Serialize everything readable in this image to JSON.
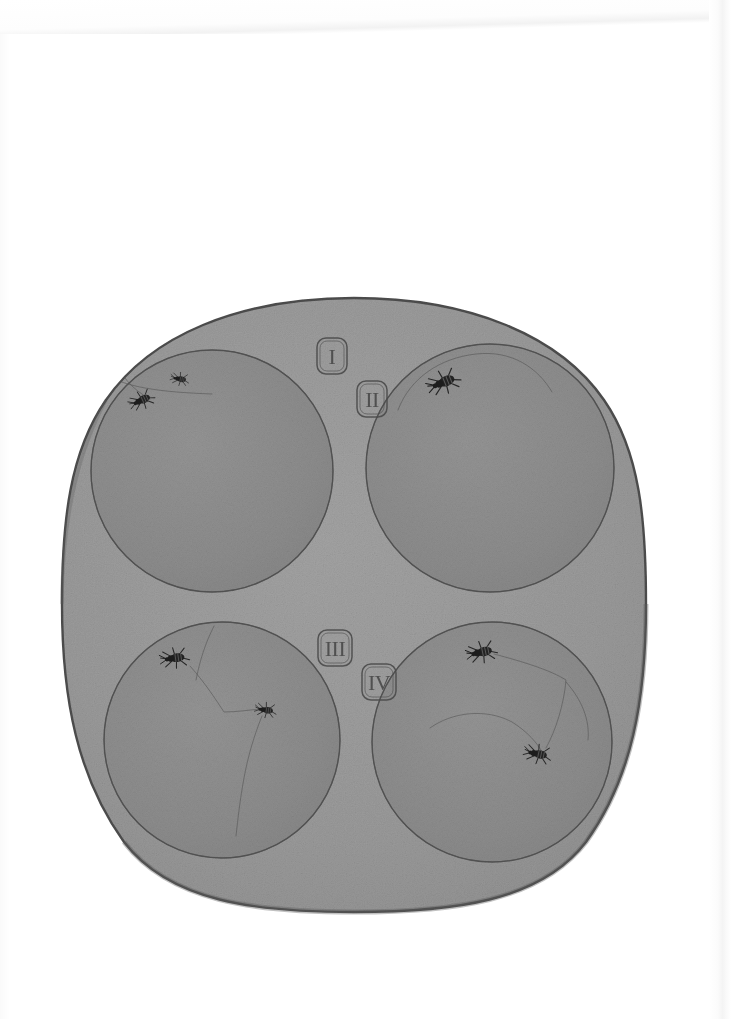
{
  "plate": {
    "medium": "pencil-and-wash drawing on paper",
    "sheet": {
      "width": 731,
      "height": 1019,
      "paper_color": "#ffffff"
    },
    "field": {
      "name": "rounded-square observation field",
      "shape": "squircle",
      "fill_color": "#9b9b9b",
      "outline_color": "#4e4e4e",
      "bounds": {
        "x": 62,
        "y": 298,
        "width": 584,
        "height": 614
      }
    },
    "arena_fill_color": "#8e8e8e",
    "arena_outline_color": "#5a5a5a",
    "insect_color": "#1d1d1d",
    "trail_color": "#555555",
    "label_frame_color": "#4a4a4a"
  },
  "labels": [
    {
      "id": "label-I",
      "text": "I",
      "x": 317,
      "y": 338,
      "w": 30,
      "h": 36
    },
    {
      "id": "label-II",
      "text": "II",
      "x": 357,
      "y": 381,
      "w": 30,
      "h": 36
    },
    {
      "id": "label-III",
      "text": "III",
      "x": 318,
      "y": 630,
      "w": 34,
      "h": 36
    },
    {
      "id": "label-IV",
      "text": "IV",
      "x": 362,
      "y": 664,
      "w": 34,
      "h": 36
    }
  ],
  "arenas": [
    {
      "id": "arena-1",
      "label": "I",
      "cx": 212,
      "cy": 471,
      "r": 121,
      "insect_count": 2,
      "insects": [
        {
          "id": "insect-1-1",
          "x": 142,
          "y": 400,
          "rot": -25,
          "size": 17
        },
        {
          "id": "insect-1-2",
          "x": 180,
          "y": 379,
          "rot": 10,
          "size": 12
        }
      ],
      "trails": [
        "M 100 372 C 126 388 160 392 212 394",
        "M 112 356 C 122 376 130 388 150 399"
      ]
    },
    {
      "id": "arena-2",
      "label": "II",
      "cx": 490,
      "cy": 468,
      "r": 124,
      "insect_count": 1,
      "insects": [
        {
          "id": "insect-2-1",
          "x": 444,
          "y": 382,
          "rot": -22,
          "size": 22
        }
      ],
      "trails": [
        "M 398 410 C 410 378 440 358 476 354 C 512 350 538 368 552 392"
      ]
    },
    {
      "id": "arena-3",
      "label": "III",
      "cx": 222,
      "cy": 740,
      "r": 118,
      "insect_count": 2,
      "insects": [
        {
          "id": "insect-3-1",
          "x": 175,
          "y": 658,
          "rot": -8,
          "size": 19
        },
        {
          "id": "insect-3-2",
          "x": 266,
          "y": 710,
          "rot": 8,
          "size": 14
        }
      ],
      "trails": [
        "M 214 626 C 205 644 200 660 196 680",
        "M 190 666 C 206 684 216 700 224 712 C 236 712 250 710 260 709",
        "M 262 716 C 254 736 248 756 244 778 C 240 800 238 818 236 836"
      ]
    },
    {
      "id": "arena-4",
      "label": "IV",
      "cx": 492,
      "cy": 742,
      "r": 120,
      "insect_count": 2,
      "insects": [
        {
          "id": "insect-4-1",
          "x": 482,
          "y": 652,
          "rot": -12,
          "size": 20
        },
        {
          "id": "insect-4-2",
          "x": 538,
          "y": 754,
          "rot": 12,
          "size": 18
        }
      ],
      "trails": [
        "M 494 654 C 524 662 550 670 566 680 C 564 704 556 730 546 748",
        "M 430 728 C 452 712 486 708 512 722 C 528 732 538 744 542 752",
        "M 566 682 C 582 700 590 720 588 740"
      ]
    }
  ],
  "totals": {
    "arena_count": 4,
    "insect_count": 7
  }
}
